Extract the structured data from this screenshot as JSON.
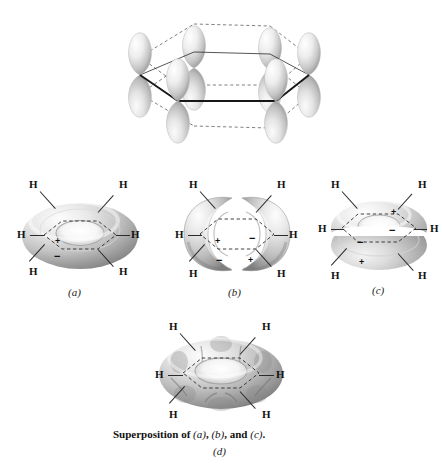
{
  "figure": {
    "kind": "benzene-pi-molecular-orbital-diagram",
    "background_color": "#ffffff",
    "ink_color": "#1a1a1a"
  },
  "top_panel": {
    "name": "six-p-orbitals-on-hexagon",
    "description": "Six p atomic orbitals on a hexagonal benzene ring drawn in perspective",
    "orbital_count": 6,
    "lobes_per_orbital": 2,
    "ring_shape": "hexagon",
    "lobe_fill_light": "#f2f2f2",
    "lobe_fill_dark": "#a8a8a8"
  },
  "panels": [
    {
      "id": "a",
      "label": "(a)",
      "shape": "continuous-torus",
      "nodes": 0,
      "h_labels": [
        "H",
        "H",
        "H",
        "H",
        "H",
        "H"
      ],
      "signs": [
        {
          "glyph": "+",
          "position": "upper-face-lower-left"
        },
        {
          "glyph": "−",
          "position": "lower-face-bottom-left"
        }
      ]
    },
    {
      "id": "b",
      "label": "(b)",
      "shape": "torus-split-vertically-two-c-lobes",
      "nodes": 1,
      "nodal_plane": "vertical",
      "h_labels": [
        "H",
        "H",
        "H",
        "H",
        "H",
        "H"
      ],
      "signs": [
        {
          "glyph": "+",
          "position": "left-inner-upper"
        },
        {
          "glyph": "−",
          "position": "right-inner-upper"
        },
        {
          "glyph": "−",
          "position": "left-lower"
        },
        {
          "glyph": "+",
          "position": "right-lower"
        }
      ]
    },
    {
      "id": "c",
      "label": "(c)",
      "shape": "torus-split-horizontally-upper-and-lower-rings",
      "nodes": 1,
      "nodal_plane": "horizontal",
      "h_labels": [
        "H",
        "H",
        "H",
        "H",
        "H",
        "H"
      ],
      "signs": [
        {
          "glyph": "+",
          "position": "upper-ring-right"
        },
        {
          "glyph": "−",
          "position": "upper-ring-front-center"
        },
        {
          "glyph": "−",
          "position": "lower-ring-left"
        },
        {
          "glyph": "+",
          "position": "lower-ring-bottom-left"
        }
      ]
    },
    {
      "id": "d",
      "label": "(d)",
      "shape": "lumpy-torus-superposition",
      "lobe_bulges": 6,
      "h_labels": [
        "H",
        "H",
        "H",
        "H",
        "H",
        "H"
      ],
      "signs": []
    }
  ],
  "captions": {
    "panel_a": "(a)",
    "panel_b": "(b)",
    "panel_c": "(c)",
    "panel_d": "(d)",
    "superposition_prefix": "Superposition of ",
    "superposition_a": "(a)",
    "superposition_sep1": ", ",
    "superposition_b": "(b)",
    "superposition_sep2": ", and ",
    "superposition_c": "(c)",
    "superposition_end": "."
  },
  "atom_label": "H",
  "sign_plus": "+",
  "sign_minus": "−"
}
